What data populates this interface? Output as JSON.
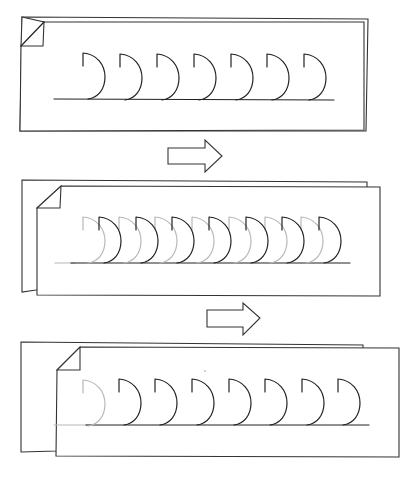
{
  "diagram": {
    "colors": {
      "ink": "#222222",
      "ghost": "#b8b8b8",
      "page": "#ffffff"
    },
    "steps": [
      {
        "name": "step-1",
        "pages": 1,
        "dark_shape_count": 7,
        "ghost_shape_count": 0
      },
      {
        "name": "step-2",
        "pages": 2,
        "dark_shape_count": 7,
        "ghost_shape_count": 7
      },
      {
        "name": "step-3",
        "pages": 2,
        "dark_shape_count": 7,
        "ghost_shape_count": 1
      }
    ],
    "arrows": [
      {
        "name": "arrow-1",
        "direction": "right"
      },
      {
        "name": "arrow-2",
        "direction": "right"
      }
    ]
  }
}
